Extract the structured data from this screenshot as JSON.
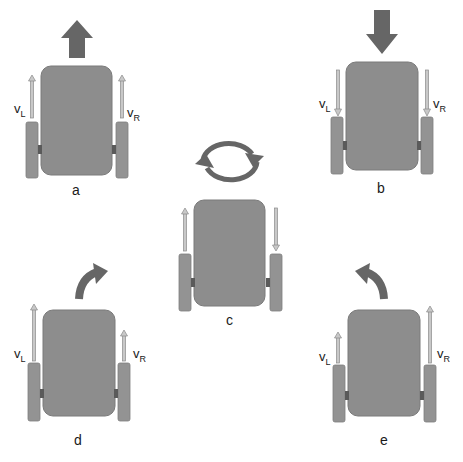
{
  "diagram": {
    "colors": {
      "background": "#ffffff",
      "body": "#8d8d8d",
      "body_stroke": "#7a7a7a",
      "wheel": "#939393",
      "axle": "#5a5a5a",
      "motion_arrow": "#666666",
      "velocity_arrow_fill": "#c8c8c8",
      "velocity_arrow_stroke": "#8a8a8a",
      "text": "#1a1a1a"
    },
    "panels": [
      {
        "id": "a",
        "caption": "a",
        "motion": "forward",
        "left_velocity": {
          "symbol": "v",
          "subscript": "L",
          "direction": "up",
          "magnitude": "full"
        },
        "right_velocity": {
          "symbol": "v",
          "subscript": "R",
          "direction": "up",
          "magnitude": "full"
        }
      },
      {
        "id": "b",
        "caption": "b",
        "motion": "backward",
        "left_velocity": {
          "symbol": "v",
          "subscript": "L",
          "direction": "down",
          "magnitude": "full"
        },
        "right_velocity": {
          "symbol": "v",
          "subscript": "R",
          "direction": "down",
          "magnitude": "full"
        }
      },
      {
        "id": "c",
        "caption": "c",
        "motion": "rotate in place",
        "left_velocity": {
          "direction": "up",
          "magnitude": "full"
        },
        "right_velocity": {
          "direction": "down",
          "magnitude": "full"
        }
      },
      {
        "id": "d",
        "caption": "d",
        "motion": "turn right",
        "left_velocity": {
          "symbol": "v",
          "subscript": "L",
          "direction": "up",
          "magnitude": "large"
        },
        "right_velocity": {
          "symbol": "v",
          "subscript": "R",
          "direction": "up",
          "magnitude": "small"
        }
      },
      {
        "id": "e",
        "caption": "e",
        "motion": "turn left",
        "left_velocity": {
          "symbol": "v",
          "subscript": "L",
          "direction": "up",
          "magnitude": "small"
        },
        "right_velocity": {
          "symbol": "v",
          "subscript": "R",
          "direction": "up",
          "magnitude": "large"
        }
      }
    ]
  }
}
